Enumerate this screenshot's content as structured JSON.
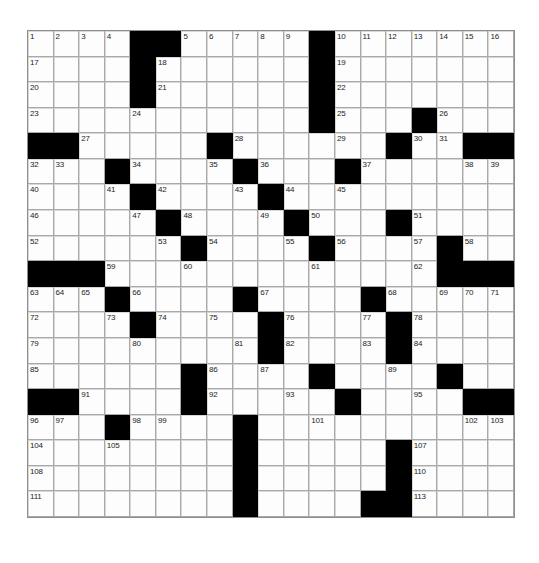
{
  "puzzle": {
    "title": "Crossword Grid",
    "rows": 19,
    "cols": 19,
    "cell_size_px": 25.6,
    "colors": {
      "block": "#000000",
      "cell": "#fdfdfd",
      "grid_line": "#a9a9a9",
      "number_text": "#1c1c1c",
      "page_background": "#ffffff"
    },
    "max_clue_number": 113,
    "blocks": [
      [
        0,
        4
      ],
      [
        0,
        5
      ],
      [
        0,
        11
      ],
      [
        1,
        4
      ],
      [
        1,
        11
      ],
      [
        2,
        4
      ],
      [
        2,
        11
      ],
      [
        3,
        11
      ],
      [
        3,
        15
      ],
      [
        4,
        0
      ],
      [
        4,
        1
      ],
      [
        4,
        7
      ],
      [
        4,
        14
      ],
      [
        4,
        17
      ],
      [
        4,
        18
      ],
      [
        5,
        3
      ],
      [
        5,
        8
      ],
      [
        5,
        12
      ],
      [
        6,
        4
      ],
      [
        6,
        9
      ],
      [
        7,
        5
      ],
      [
        7,
        10
      ],
      [
        7,
        14
      ],
      [
        8,
        6
      ],
      [
        8,
        11
      ],
      [
        8,
        16
      ],
      [
        9,
        0
      ],
      [
        9,
        1
      ],
      [
        9,
        2
      ],
      [
        9,
        16
      ],
      [
        9,
        17
      ],
      [
        9,
        18
      ],
      [
        10,
        3
      ],
      [
        10,
        8
      ],
      [
        10,
        13
      ],
      [
        11,
        4
      ],
      [
        11,
        9
      ],
      [
        11,
        14
      ],
      [
        12,
        9
      ],
      [
        12,
        14
      ],
      [
        13,
        6
      ],
      [
        13,
        11
      ],
      [
        13,
        16
      ],
      [
        14,
        0
      ],
      [
        14,
        1
      ],
      [
        14,
        6
      ],
      [
        14,
        12
      ],
      [
        14,
        17
      ],
      [
        14,
        18
      ],
      [
        15,
        3
      ],
      [
        15,
        8
      ],
      [
        16,
        8
      ],
      [
        16,
        14
      ],
      [
        17,
        8
      ],
      [
        17,
        14
      ],
      [
        18,
        8
      ],
      [
        18,
        13
      ],
      [
        18,
        14
      ]
    ],
    "numbers": [
      {
        "r": 0,
        "c": 0,
        "n": "1"
      },
      {
        "r": 0,
        "c": 1,
        "n": "2"
      },
      {
        "r": 0,
        "c": 2,
        "n": "3"
      },
      {
        "r": 0,
        "c": 3,
        "n": "4"
      },
      {
        "r": 0,
        "c": 6,
        "n": "5"
      },
      {
        "r": 0,
        "c": 7,
        "n": "6"
      },
      {
        "r": 0,
        "c": 8,
        "n": "7"
      },
      {
        "r": 0,
        "c": 9,
        "n": "8"
      },
      {
        "r": 0,
        "c": 10,
        "n": "9"
      },
      {
        "r": 0,
        "c": 12,
        "n": "10"
      },
      {
        "r": 0,
        "c": 13,
        "n": "11"
      },
      {
        "r": 0,
        "c": 14,
        "n": "12"
      },
      {
        "r": 0,
        "c": 15,
        "n": "13"
      },
      {
        "r": 0,
        "c": 16,
        "n": "14"
      },
      {
        "r": 0,
        "c": 17,
        "n": "15"
      },
      {
        "r": 0,
        "c": 18,
        "n": "16"
      },
      {
        "r": 1,
        "c": 0,
        "n": "17"
      },
      {
        "r": 1,
        "c": 5,
        "n": "18"
      },
      {
        "r": 1,
        "c": 12,
        "n": "19"
      },
      {
        "r": 2,
        "c": 0,
        "n": "20"
      },
      {
        "r": 2,
        "c": 5,
        "n": "21"
      },
      {
        "r": 2,
        "c": 12,
        "n": "22"
      },
      {
        "r": 3,
        "c": 0,
        "n": "23"
      },
      {
        "r": 3,
        "c": 4,
        "n": "24"
      },
      {
        "r": 3,
        "c": 12,
        "n": "25"
      },
      {
        "r": 3,
        "c": 16,
        "n": "26"
      },
      {
        "r": 4,
        "c": 2,
        "n": "27"
      },
      {
        "r": 4,
        "c": 8,
        "n": "28"
      },
      {
        "r": 4,
        "c": 12,
        "n": "29"
      },
      {
        "r": 4,
        "c": 15,
        "n": "30"
      },
      {
        "r": 4,
        "c": 16,
        "n": "31"
      },
      {
        "r": 5,
        "c": 0,
        "n": "32"
      },
      {
        "r": 5,
        "c": 1,
        "n": "33"
      },
      {
        "r": 5,
        "c": 4,
        "n": "34"
      },
      {
        "r": 5,
        "c": 7,
        "n": "35"
      },
      {
        "r": 5,
        "c": 9,
        "n": "36"
      },
      {
        "r": 5,
        "c": 13,
        "n": "37"
      },
      {
        "r": 5,
        "c": 17,
        "n": "38"
      },
      {
        "r": 5,
        "c": 18,
        "n": "39"
      },
      {
        "r": 6,
        "c": 0,
        "n": "40"
      },
      {
        "r": 6,
        "c": 3,
        "n": "41"
      },
      {
        "r": 6,
        "c": 5,
        "n": "42"
      },
      {
        "r": 6,
        "c": 8,
        "n": "43"
      },
      {
        "r": 6,
        "c": 10,
        "n": "44"
      },
      {
        "r": 6,
        "c": 12,
        "n": "45"
      },
      {
        "r": 7,
        "c": 0,
        "n": "46"
      },
      {
        "r": 7,
        "c": 4,
        "n": "47"
      },
      {
        "r": 7,
        "c": 6,
        "n": "48"
      },
      {
        "r": 7,
        "c": 9,
        "n": "49"
      },
      {
        "r": 7,
        "c": 11,
        "n": "50"
      },
      {
        "r": 7,
        "c": 15,
        "n": "51"
      },
      {
        "r": 8,
        "c": 0,
        "n": "52"
      },
      {
        "r": 8,
        "c": 5,
        "n": "53"
      },
      {
        "r": 8,
        "c": 7,
        "n": "54"
      },
      {
        "r": 8,
        "c": 10,
        "n": "55"
      },
      {
        "r": 8,
        "c": 12,
        "n": "56"
      },
      {
        "r": 8,
        "c": 15,
        "n": "57"
      },
      {
        "r": 8,
        "c": 17,
        "n": "58"
      },
      {
        "r": 9,
        "c": 3,
        "n": "59"
      },
      {
        "r": 9,
        "c": 6,
        "n": "60"
      },
      {
        "r": 9,
        "c": 11,
        "n": "61"
      },
      {
        "r": 9,
        "c": 15,
        "n": "62"
      },
      {
        "r": 10,
        "c": 0,
        "n": "63"
      },
      {
        "r": 10,
        "c": 1,
        "n": "64"
      },
      {
        "r": 10,
        "c": 2,
        "n": "65"
      },
      {
        "r": 10,
        "c": 4,
        "n": "66"
      },
      {
        "r": 10,
        "c": 9,
        "n": "67"
      },
      {
        "r": 10,
        "c": 14,
        "n": "68"
      },
      {
        "r": 10,
        "c": 16,
        "n": "69"
      },
      {
        "r": 10,
        "c": 17,
        "n": "70"
      },
      {
        "r": 10,
        "c": 18,
        "n": "71"
      },
      {
        "r": 11,
        "c": 0,
        "n": "72"
      },
      {
        "r": 11,
        "c": 3,
        "n": "73"
      },
      {
        "r": 11,
        "c": 5,
        "n": "74"
      },
      {
        "r": 11,
        "c": 7,
        "n": "75"
      },
      {
        "r": 11,
        "c": 10,
        "n": "76"
      },
      {
        "r": 11,
        "c": 13,
        "n": "77"
      },
      {
        "r": 11,
        "c": 15,
        "n": "78"
      },
      {
        "r": 12,
        "c": 0,
        "n": "79"
      },
      {
        "r": 12,
        "c": 4,
        "n": "80"
      },
      {
        "r": 12,
        "c": 8,
        "n": "81"
      },
      {
        "r": 12,
        "c": 10,
        "n": "82"
      },
      {
        "r": 12,
        "c": 13,
        "n": "83"
      },
      {
        "r": 12,
        "c": 15,
        "n": "84"
      },
      {
        "r": 13,
        "c": 0,
        "n": "85"
      },
      {
        "r": 13,
        "c": 7,
        "n": "86"
      },
      {
        "r": 13,
        "c": 9,
        "n": "87"
      },
      {
        "r": 13,
        "c": 11,
        "n": "88"
      },
      {
        "r": 13,
        "c": 14,
        "n": "89"
      },
      {
        "r": 13,
        "c": 16,
        "n": "90"
      },
      {
        "r": 14,
        "c": 2,
        "n": "91"
      },
      {
        "r": 14,
        "c": 7,
        "n": "92"
      },
      {
        "r": 14,
        "c": 10,
        "n": "93"
      },
      {
        "r": 14,
        "c": 12,
        "n": "94"
      },
      {
        "r": 14,
        "c": 15,
        "n": "95"
      },
      {
        "r": 15,
        "c": 0,
        "n": "96"
      },
      {
        "r": 15,
        "c": 1,
        "n": "97"
      },
      {
        "r": 15,
        "c": 4,
        "n": "98"
      },
      {
        "r": 15,
        "c": 5,
        "n": "99"
      },
      {
        "r": 15,
        "c": 8,
        "n": "100"
      },
      {
        "r": 15,
        "c": 11,
        "n": "101"
      },
      {
        "r": 15,
        "c": 17,
        "n": "102"
      },
      {
        "r": 15,
        "c": 18,
        "n": "103"
      },
      {
        "r": 16,
        "c": 0,
        "n": "104"
      },
      {
        "r": 16,
        "c": 3,
        "n": "105"
      },
      {
        "r": 16,
        "c": 8,
        "n": "106"
      },
      {
        "r": 16,
        "c": 15,
        "n": "107"
      },
      {
        "r": 17,
        "c": 0,
        "n": "108"
      },
      {
        "r": 17,
        "c": 8,
        "n": "109"
      },
      {
        "r": 17,
        "c": 15,
        "n": "110"
      },
      {
        "r": 18,
        "c": 0,
        "n": "111"
      },
      {
        "r": 18,
        "c": 8,
        "n": "112"
      },
      {
        "r": 18,
        "c": 15,
        "n": "113"
      }
    ]
  }
}
